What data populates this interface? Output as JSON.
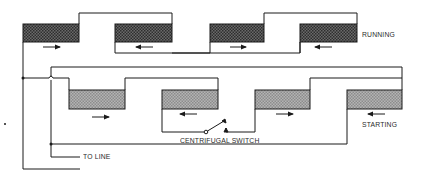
{
  "diagram": {
    "title": "",
    "windings": [
      {
        "name": "running",
        "label": "RUNNING",
        "fill": "#4a4a4a",
        "coils": [
          {
            "x": 23,
            "y": 24,
            "w": 56,
            "h": 18,
            "arrow": "right"
          },
          {
            "x": 115,
            "y": 24,
            "w": 57,
            "h": 18,
            "arrow": "left"
          },
          {
            "x": 210,
            "y": 24,
            "w": 54,
            "h": 18,
            "arrow": "right"
          },
          {
            "x": 300,
            "y": 24,
            "w": 57,
            "h": 18,
            "arrow": "left"
          }
        ]
      },
      {
        "name": "starting",
        "label": "STARTING",
        "fill": "#8a8a8a",
        "coils": [
          {
            "x": 69,
            "y": 90,
            "w": 56,
            "h": 19,
            "arrow": "right"
          },
          {
            "x": 162,
            "y": 90,
            "w": 56,
            "h": 19,
            "arrow": "left"
          },
          {
            "x": 255,
            "y": 90,
            "w": 55,
            "h": 19,
            "arrow": "right"
          },
          {
            "x": 347,
            "y": 90,
            "w": 55,
            "h": 19,
            "arrow": "left"
          }
        ]
      }
    ],
    "labels": {
      "running": "RUNNING",
      "starting": "STARTING",
      "centrifugal_switch": "CENTRIFUGAL SWITCH",
      "to_line": "TO LINE"
    },
    "colors": {
      "line": "#1a1a1a",
      "running_fill": "#4a4a4a",
      "starting_fill": "#8a8a8a"
    }
  }
}
